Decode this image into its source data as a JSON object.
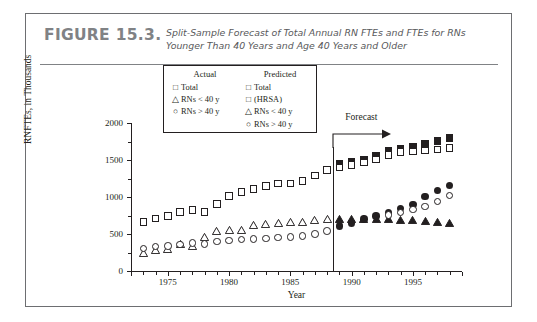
{
  "figure": {
    "number": "FIGURE 15.3.",
    "caption": "Split-Sample Forecast of Total Annual RN FTEs and FTEs for RNs Younger Than 40 Years and Age 40 Years and Older"
  },
  "legend": {
    "actual_header": "Actual",
    "predicted_header": "Predicted",
    "actual_items": [
      {
        "symbol": "□",
        "label": "Total"
      },
      {
        "symbol": "△",
        "label": "RNs < 40 y"
      },
      {
        "symbol": "○",
        "label": "RNs > 40 y"
      }
    ],
    "predicted_items": [
      {
        "symbol": "□",
        "label": "Total"
      },
      {
        "symbol": "□",
        "label": "(HRSA)"
      },
      {
        "symbol": "△",
        "label": "RNs < 40 y"
      },
      {
        "symbol": "○",
        "label": "RNs > 40 y"
      }
    ]
  },
  "annotation": {
    "forecast_label": "Forecast",
    "forecast_year": 1988.5
  },
  "chart_data": {
    "type": "scatter",
    "title": "Split-Sample Forecast of Total Annual RN FTEs and FTEs for RNs Younger Than 40 Years and Age 40 Years and Older",
    "xlabel": "Year",
    "ylabel": "RNFTEs, in Thousands",
    "xlim": [
      1972,
      1999
    ],
    "ylim": [
      0,
      2000
    ],
    "xticks": [
      1975,
      1980,
      1985,
      1990,
      1995
    ],
    "yticks": [
      0,
      500,
      1000,
      1500,
      2000
    ],
    "yticks_minor": [
      250,
      750,
      1250,
      1750
    ],
    "grid": false,
    "legend_position": "top-center",
    "forecast_start": 1988.5,
    "series": [
      {
        "name": "Actual Total",
        "marker": "square-open",
        "x": [
          1973,
          1974,
          1975,
          1976,
          1977,
          1978,
          1979,
          1980,
          1981,
          1982,
          1983,
          1984,
          1985,
          1986,
          1987,
          1988
        ],
        "y": [
          660,
          710,
          745,
          800,
          825,
          800,
          905,
          1015,
          1070,
          1105,
          1150,
          1180,
          1180,
          1215,
          1290,
          1365
        ]
      },
      {
        "name": "Actual RNs < 40 y",
        "marker": "triangle-open",
        "x": [
          1973,
          1974,
          1975,
          1976,
          1977,
          1978,
          1979,
          1980,
          1981,
          1982,
          1983,
          1984,
          1985,
          1986,
          1987,
          1988
        ],
        "y": [
          330,
          360,
          380,
          450,
          415,
          535,
          620,
          640,
          640,
          700,
          720,
          725,
          740,
          750,
          775,
          780
        ]
      },
      {
        "name": "Actual RNs > 40 y",
        "marker": "circle-open",
        "x": [
          1973,
          1974,
          1975,
          1976,
          1977,
          1978,
          1979,
          1980,
          1981,
          1982,
          1983,
          1984,
          1985,
          1986,
          1987,
          1988
        ],
        "y": [
          305,
          330,
          340,
          360,
          380,
          365,
          400,
          415,
          425,
          435,
          440,
          450,
          460,
          470,
          500,
          540
        ]
      },
      {
        "name": "Predicted Total",
        "marker": "square-filled",
        "x": [
          1989,
          1990,
          1991,
          1992,
          1993,
          1994,
          1995,
          1996,
          1997,
          1998
        ],
        "y": [
          1450,
          1480,
          1510,
          1560,
          1625,
          1655,
          1680,
          1720,
          1760,
          1800
        ]
      },
      {
        "name": "Predicted Total (HRSA)",
        "marker": "square-open",
        "x": [
          1989,
          1990,
          1991,
          1992,
          1993,
          1994,
          1995,
          1996,
          1997,
          1998
        ],
        "y": [
          1400,
          1430,
          1465,
          1510,
          1565,
          1610,
          1615,
          1630,
          1640,
          1660
        ]
      },
      {
        "name": "Predicted RNs < 40 y",
        "marker": "triangle-filled",
        "x": [
          1989,
          1990,
          1991,
          1992,
          1993,
          1994,
          1995,
          1996,
          1997,
          1998
        ],
        "y": [
          790,
          790,
          790,
          785,
          780,
          775,
          770,
          760,
          750,
          735
        ]
      },
      {
        "name": "Predicted RNs > 40 y",
        "marker": "circle-filled",
        "x": [
          1989,
          1990,
          1991,
          1992,
          1993,
          1994,
          1995,
          1996,
          1997,
          1998
        ],
        "y": [
          605,
          650,
          700,
          745,
          790,
          845,
          900,
          1010,
          1085,
          1155
        ]
      },
      {
        "name": "Predicted RNs > 40 y (open)",
        "marker": "circle-open",
        "x": [
          1993,
          1994,
          1995,
          1996,
          1997,
          1998
        ],
        "y": [
          760,
          790,
          830,
          870,
          940,
          1020
        ]
      }
    ]
  }
}
